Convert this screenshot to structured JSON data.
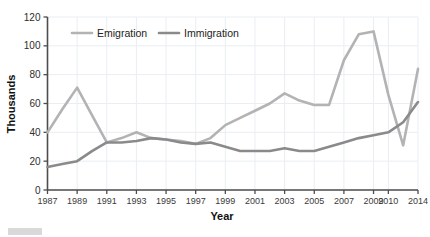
{
  "chart_data": {
    "type": "line",
    "title": "",
    "xlabel": "Year",
    "ylabel": "Thousands",
    "ylim": [
      0,
      120
    ],
    "yticks": [
      0,
      20,
      40,
      60,
      80,
      100,
      120
    ],
    "grid": true,
    "legend_position": "top-center",
    "categories": [
      "1987",
      "1988",
      "1989",
      "1990",
      "1991",
      "1992",
      "1993",
      "1994",
      "1995",
      "1996",
      "1997",
      "1998",
      "1999",
      "2000",
      "2001",
      "2002",
      "2003",
      "2004",
      "2005",
      "2006",
      "2007",
      "2008",
      "2009",
      "2010",
      "2011",
      "2014"
    ],
    "xticks": [
      "1987",
      "1989",
      "1991",
      "1993",
      "1995",
      "1997",
      "1999",
      "2001",
      "2003",
      "2005",
      "2007",
      "2009",
      "2010",
      "2014"
    ],
    "series": [
      {
        "name": "Emigration",
        "color": "#b3b3b3",
        "values": [
          40,
          56,
          71,
          52,
          33,
          36,
          40,
          36,
          35,
          34,
          32,
          36,
          45,
          50,
          55,
          60,
          67,
          62,
          59,
          59,
          90,
          108,
          110,
          66,
          31,
          84
        ]
      },
      {
        "name": "Immigration",
        "color": "#8a8a8a",
        "values": [
          16,
          18,
          20,
          27,
          33,
          33,
          34,
          36,
          35,
          33,
          32,
          33,
          30,
          27,
          27,
          27,
          29,
          27,
          27,
          30,
          33,
          36,
          38,
          40,
          47,
          61
        ]
      }
    ]
  },
  "legend": {
    "items": [
      {
        "label": "Emigration",
        "color": "#b3b3b3"
      },
      {
        "label": "Immigration",
        "color": "#8a8a8a"
      }
    ]
  },
  "axes": {
    "x_title": "Year",
    "y_title": "Thousands"
  }
}
